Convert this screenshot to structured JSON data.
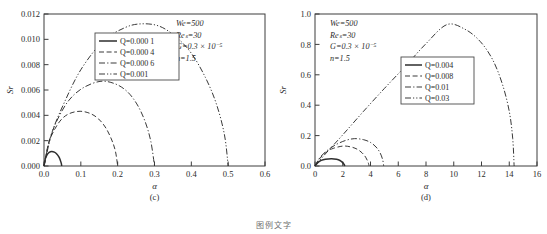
{
  "figure": {
    "caption_partial": "图例文字",
    "panels": [
      {
        "id": "c",
        "label": "(c)",
        "xlabel": "α",
        "ylabel": "Sr"
      },
      {
        "id": "d",
        "label": "(d)",
        "xlabel": "α",
        "ylabel": "Sr"
      }
    ]
  },
  "chart_data": [
    {
      "type": "line",
      "panel": "c",
      "title": "",
      "xlabel": "α",
      "ylabel": "Sr",
      "xlim": [
        0.0,
        0.6
      ],
      "ylim": [
        0.0,
        0.012
      ],
      "xticks": [
        "0.0",
        "0.1",
        "0.2",
        "0.3",
        "0.4",
        "0.5",
        "0.6"
      ],
      "xtick_values": [
        0.0,
        0.1,
        0.2,
        0.3,
        0.4,
        0.5,
        0.6
      ],
      "yticks": [
        "0.000",
        "0.002",
        "0.004",
        "0.006",
        "0.008",
        "0.010",
        "0.012"
      ],
      "ytick_values": [
        0.0,
        0.002,
        0.004,
        0.006,
        0.008,
        0.01,
        0.012
      ],
      "grid": false,
      "legend_position": "upper-center",
      "annotations": [
        "We=500",
        "Reₛ=30",
        "G=0.3 × 10⁻⁵",
        "n=1.5"
      ],
      "series": [
        {
          "name": "Q=0.000 1",
          "style": "solid",
          "cutoff": 0.048,
          "peak_x": 0.021,
          "peak_y": 0.00115,
          "points_x": [
            0.0,
            0.004,
            0.009,
            0.014,
            0.021,
            0.028,
            0.034,
            0.04,
            0.044,
            0.047,
            0.048
          ],
          "points_y": [
            0.0,
            0.00062,
            0.00092,
            0.00108,
            0.00115,
            0.0011,
            0.00097,
            0.00074,
            0.00048,
            0.00021,
            0.0
          ]
        },
        {
          "name": "Q=0.000 4",
          "style": "dashed",
          "cutoff": 0.2,
          "peak_x": 0.098,
          "peak_y": 0.00432,
          "points_x": [
            0.0,
            0.012,
            0.028,
            0.048,
            0.07,
            0.098,
            0.125,
            0.148,
            0.168,
            0.184,
            0.194,
            0.2
          ],
          "points_y": [
            0.0,
            0.00175,
            0.00285,
            0.0037,
            0.00415,
            0.00432,
            0.00415,
            0.00372,
            0.003,
            0.00205,
            0.00115,
            0.0
          ]
        },
        {
          "name": "Q=0.000 6",
          "style": "dashdot",
          "cutoff": 0.3,
          "peak_x": 0.152,
          "peak_y": 0.00668,
          "points_x": [
            0.0,
            0.016,
            0.038,
            0.068,
            0.105,
            0.152,
            0.192,
            0.225,
            0.252,
            0.274,
            0.29,
            0.3
          ],
          "points_y": [
            0.0,
            0.00215,
            0.00375,
            0.0052,
            0.00615,
            0.00668,
            0.0065,
            0.0059,
            0.0049,
            0.00355,
            0.00195,
            0.0
          ]
        },
        {
          "name": "Q=0.001",
          "style": "dashdotdot",
          "cutoff": 0.5,
          "peak_x": 0.262,
          "peak_y": 0.01122,
          "points_x": [
            0.0,
            0.022,
            0.055,
            0.1,
            0.16,
            0.218,
            0.262,
            0.312,
            0.358,
            0.4,
            0.438,
            0.468,
            0.49,
            0.5
          ],
          "points_y": [
            0.0,
            0.00265,
            0.005,
            0.0076,
            0.00985,
            0.0109,
            0.01122,
            0.01105,
            0.0102,
            0.0089,
            0.007,
            0.0049,
            0.00245,
            0.0
          ]
        }
      ]
    },
    {
      "type": "line",
      "panel": "d",
      "title": "",
      "xlabel": "α",
      "ylabel": "Sr",
      "xlim": [
        0,
        16
      ],
      "ylim": [
        0.0,
        1.0
      ],
      "xticks": [
        "0",
        "2",
        "4",
        "6",
        "8",
        "10",
        "12",
        "14",
        "16"
      ],
      "xtick_values": [
        0,
        2,
        4,
        6,
        8,
        10,
        12,
        14,
        16
      ],
      "yticks": [
        "0.0",
        "0.2",
        "0.4",
        "0.6",
        "0.8",
        "1.0"
      ],
      "ytick_values": [
        0.0,
        0.2,
        0.4,
        0.6,
        0.8,
        1.0
      ],
      "grid": false,
      "legend_position": "center-right",
      "annotations": [
        "We=500",
        "Reₛ=30",
        "G=0.3 × 10⁻⁵",
        "n=1.5"
      ],
      "series": [
        {
          "name": "Q=0.004",
          "style": "solid",
          "cutoff": 2.15,
          "peak_x": 1.2,
          "peak_y": 0.048,
          "points_x": [
            0.0,
            0.2,
            0.45,
            0.75,
            1.2,
            1.55,
            1.8,
            2.0,
            2.1,
            2.15
          ],
          "points_y": [
            0.0,
            0.022,
            0.037,
            0.045,
            0.048,
            0.044,
            0.036,
            0.022,
            0.01,
            0.0
          ]
        },
        {
          "name": "Q=0.008",
          "style": "dashed",
          "cutoff": 3.9,
          "peak_x": 2.0,
          "peak_y": 0.131,
          "points_x": [
            0.0,
            0.3,
            0.7,
            1.2,
            2.0,
            2.6,
            3.05,
            3.4,
            3.65,
            3.82,
            3.9
          ],
          "points_y": [
            0.0,
            0.045,
            0.082,
            0.112,
            0.131,
            0.125,
            0.11,
            0.086,
            0.058,
            0.026,
            0.0
          ]
        },
        {
          "name": "Q=0.01",
          "style": "dashdot",
          "cutoff": 4.95,
          "peak_x": 2.85,
          "peak_y": 0.18,
          "points_x": [
            0.0,
            0.35,
            0.85,
            1.5,
            2.2,
            2.85,
            3.5,
            4.0,
            4.4,
            4.7,
            4.88,
            4.95
          ],
          "points_y": [
            0.0,
            0.055,
            0.1,
            0.14,
            0.168,
            0.18,
            0.173,
            0.155,
            0.125,
            0.085,
            0.04,
            0.0
          ]
        },
        {
          "name": "Q=0.03",
          "style": "dashdotdot",
          "cutoff": 14.35,
          "peak_x": 9.5,
          "peak_y": 0.93,
          "points_x": [
            0.0,
            0.8,
            2.0,
            3.5,
            5.0,
            6.5,
            8.0,
            9.5,
            10.8,
            11.9,
            12.8,
            13.5,
            14.0,
            14.25,
            14.35
          ],
          "points_y": [
            0.0,
            0.085,
            0.205,
            0.36,
            0.51,
            0.655,
            0.805,
            0.93,
            0.9,
            0.82,
            0.7,
            0.54,
            0.36,
            0.18,
            0.0
          ]
        }
      ]
    }
  ]
}
